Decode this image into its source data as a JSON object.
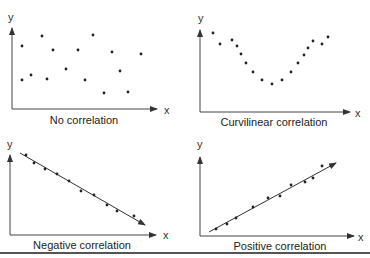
{
  "colors": {
    "ink": "#222222",
    "axis": "#444444",
    "rule": "#555555"
  },
  "chart_data": [
    {
      "type": "scatter",
      "title": "No correlation",
      "xlabel": "x",
      "ylabel": "y",
      "grid": false,
      "trendline": false,
      "points": [
        [
          22,
          46
        ],
        [
          42,
          36
        ],
        [
          53,
          50
        ],
        [
          78,
          50
        ],
        [
          93,
          35
        ],
        [
          112,
          52
        ],
        [
          141,
          54
        ],
        [
          22,
          80
        ],
        [
          31,
          75
        ],
        [
          47,
          79
        ],
        [
          66,
          69
        ],
        [
          85,
          80
        ],
        [
          104,
          93
        ],
        [
          120,
          71
        ],
        [
          128,
          92
        ]
      ]
    },
    {
      "type": "scatter",
      "title": "Curvilinear correlation",
      "xlabel": "x",
      "ylabel": "y",
      "grid": false,
      "trendline": false,
      "points": [
        [
          213,
          33
        ],
        [
          220,
          44
        ],
        [
          232,
          40
        ],
        [
          237,
          46
        ],
        [
          241,
          54
        ],
        [
          246,
          63
        ],
        [
          253,
          72
        ],
        [
          262,
          80
        ],
        [
          272,
          84
        ],
        [
          282,
          80
        ],
        [
          291,
          72
        ],
        [
          298,
          63
        ],
        [
          304,
          55
        ],
        [
          308,
          48
        ],
        [
          313,
          41
        ],
        [
          322,
          44
        ],
        [
          328,
          37
        ]
      ]
    },
    {
      "type": "scatter",
      "title": "Negative correlation",
      "xlabel": "x",
      "ylabel": "y",
      "grid": false,
      "trendline": true,
      "trend": [
        [
          20,
          153
        ],
        [
          145,
          225
        ]
      ],
      "points": [
        [
          26,
          155
        ],
        [
          34,
          163
        ],
        [
          45,
          169
        ],
        [
          57,
          174
        ],
        [
          69,
          181
        ],
        [
          81,
          191
        ],
        [
          94,
          195
        ],
        [
          107,
          205
        ],
        [
          117,
          211
        ],
        [
          134,
          216
        ]
      ]
    },
    {
      "type": "scatter",
      "title": "Positive correlation",
      "xlabel": "x",
      "ylabel": "y",
      "grid": false,
      "trendline": true,
      "trend": [
        [
          209,
          232
        ],
        [
          336,
          163
        ]
      ],
      "points": [
        [
          216,
          229
        ],
        [
          227,
          224
        ],
        [
          236,
          218
        ],
        [
          253,
          207
        ],
        [
          268,
          198
        ],
        [
          280,
          196
        ],
        [
          291,
          185
        ],
        [
          305,
          182
        ],
        [
          313,
          178
        ],
        [
          322,
          166
        ]
      ]
    }
  ],
  "panels": {
    "no_correlation": {
      "caption": "No correlation",
      "x_label": "x",
      "y_label": "y"
    },
    "curvilinear": {
      "caption": "Curvilinear correlation",
      "x_label": "x",
      "y_label": "y"
    },
    "negative": {
      "caption": "Negative correlation",
      "x_label": "x",
      "y_label": "y"
    },
    "positive": {
      "caption": "Positive correlation",
      "x_label": "x",
      "y_label": "y"
    }
  }
}
